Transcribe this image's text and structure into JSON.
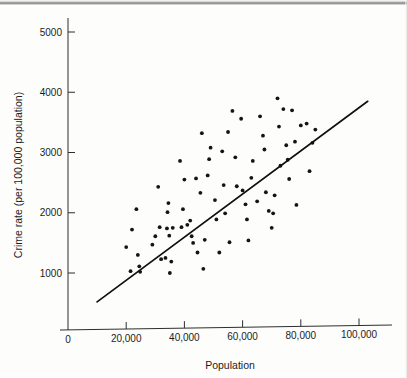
{
  "chart_data": {
    "type": "scatter",
    "title": "",
    "xlabel": "Population",
    "ylabel": "Crime rate (per 100,000 population)",
    "xlim": [
      0,
      107000
    ],
    "ylim": [
      0,
      5400
    ],
    "grid": false,
    "legend": "none",
    "xticks": [
      0,
      20000,
      40000,
      60000,
      80000,
      100000
    ],
    "xtick_labels": [
      "0",
      "20,000",
      "40,000",
      "60,000",
      "80,000",
      "100,000"
    ],
    "yticks": [
      1000,
      2000,
      3000,
      4000,
      5000
    ],
    "ytick_labels": [
      "1000",
      "2000",
      "3000",
      "4000",
      "5000"
    ],
    "marker": "filled-circle",
    "marker_color": "#141414",
    "points": [
      [
        20000,
        1430
      ],
      [
        21500,
        1030
      ],
      [
        22000,
        1720
      ],
      [
        23500,
        2060
      ],
      [
        24000,
        1300
      ],
      [
        24500,
        1110
      ],
      [
        24800,
        1020
      ],
      [
        29000,
        1470
      ],
      [
        30000,
        1610
      ],
      [
        31000,
        2430
      ],
      [
        31500,
        1760
      ],
      [
        32000,
        1230
      ],
      [
        33500,
        1250
      ],
      [
        34000,
        1740
      ],
      [
        34200,
        2010
      ],
      [
        34500,
        2160
      ],
      [
        34800,
        1620
      ],
      [
        35000,
        1000
      ],
      [
        35500,
        1190
      ],
      [
        36000,
        1750
      ],
      [
        38500,
        2860
      ],
      [
        39000,
        1760
      ],
      [
        39500,
        2060
      ],
      [
        40000,
        2550
      ],
      [
        41000,
        1800
      ],
      [
        42000,
        1870
      ],
      [
        42500,
        1610
      ],
      [
        43000,
        1500
      ],
      [
        44000,
        2570
      ],
      [
        44500,
        1340
      ],
      [
        45500,
        2330
      ],
      [
        46000,
        3320
      ],
      [
        46500,
        1070
      ],
      [
        47000,
        1550
      ],
      [
        48000,
        2620
      ],
      [
        48500,
        2890
      ],
      [
        49000,
        3080
      ],
      [
        50500,
        2210
      ],
      [
        51000,
        1890
      ],
      [
        52000,
        1340
      ],
      [
        53000,
        3020
      ],
      [
        53500,
        2460
      ],
      [
        54000,
        1990
      ],
      [
        55000,
        3340
      ],
      [
        55500,
        1510
      ],
      [
        56500,
        3690
      ],
      [
        57500,
        2920
      ],
      [
        58000,
        2440
      ],
      [
        59500,
        3560
      ],
      [
        60000,
        2370
      ],
      [
        61000,
        2140
      ],
      [
        61500,
        1890
      ],
      [
        62000,
        1540
      ],
      [
        63000,
        2580
      ],
      [
        63500,
        2860
      ],
      [
        65000,
        2190
      ],
      [
        66000,
        3600
      ],
      [
        67000,
        3280
      ],
      [
        67500,
        3050
      ],
      [
        68000,
        2340
      ],
      [
        69000,
        2030
      ],
      [
        70000,
        1750
      ],
      [
        70500,
        1990
      ],
      [
        71000,
        2290
      ],
      [
        72000,
        3900
      ],
      [
        72500,
        3430
      ],
      [
        73000,
        2780
      ],
      [
        74000,
        3720
      ],
      [
        75000,
        3120
      ],
      [
        75500,
        2880
      ],
      [
        76000,
        2560
      ],
      [
        77000,
        3700
      ],
      [
        78000,
        3180
      ],
      [
        78500,
        2130
      ],
      [
        80000,
        3450
      ],
      [
        82000,
        3480
      ],
      [
        83000,
        2690
      ],
      [
        84000,
        3160
      ],
      [
        85000,
        3380
      ]
    ],
    "fit_line": {
      "label": "regression line",
      "x_start": 10000,
      "y_start": 520,
      "x_end": 103000,
      "y_end": 3850
    }
  }
}
